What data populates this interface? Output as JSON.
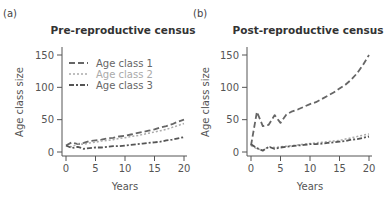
{
  "chart_data": [
    {
      "type": "line",
      "panel": "(a)",
      "title": "Pre-reproductive census",
      "xlabel": "Years",
      "ylabel": "Age class size",
      "xlim": [
        0,
        20
      ],
      "ylim": [
        0,
        150
      ],
      "xticks": [
        0,
        5,
        10,
        15,
        20
      ],
      "yticks": [
        0,
        50,
        100,
        150
      ],
      "grid": false,
      "legend_position": "upper left",
      "x": [
        0,
        1,
        2,
        3,
        4,
        5,
        6,
        7,
        8,
        9,
        10,
        11,
        12,
        13,
        14,
        15,
        16,
        17,
        18,
        19,
        20
      ],
      "series": [
        {
          "name": "Age class 1",
          "style": "dashed",
          "color": "#666666",
          "values": [
            10,
            15,
            12,
            14,
            17,
            18,
            19,
            21,
            22,
            24,
            25,
            27,
            29,
            31,
            33,
            35,
            38,
            40,
            43,
            47,
            50
          ]
        },
        {
          "name": "Age class 2",
          "style": "dotted",
          "color": "#aaaaaa",
          "values": [
            10,
            8,
            13,
            12,
            14,
            15,
            17,
            18,
            19,
            21,
            22,
            24,
            25,
            27,
            29,
            31,
            33,
            35,
            38,
            41,
            44
          ]
        },
        {
          "name": "Age class 3",
          "style": "dash-dot",
          "color": "#555555",
          "values": [
            10,
            6,
            8,
            5,
            6,
            7,
            7,
            8,
            9,
            9,
            10,
            11,
            12,
            13,
            14,
            15,
            16,
            18,
            19,
            21,
            23
          ]
        }
      ]
    },
    {
      "type": "line",
      "panel": "(b)",
      "title": "Post-reproductive census",
      "xlabel": "Years",
      "ylabel": "Age class size",
      "xlim": [
        0,
        20
      ],
      "ylim": [
        0,
        150
      ],
      "xticks": [
        0,
        5,
        10,
        15,
        20
      ],
      "yticks": [
        0,
        50,
        100,
        150
      ],
      "grid": false,
      "x": [
        0,
        1,
        2,
        3,
        4,
        5,
        6,
        7,
        8,
        9,
        10,
        11,
        12,
        13,
        14,
        15,
        16,
        17,
        18,
        19,
        20
      ],
      "series": [
        {
          "name": "Age class 1",
          "style": "dashed",
          "color": "#666666",
          "values": [
            10,
            62,
            40,
            42,
            57,
            45,
            58,
            63,
            66,
            70,
            74,
            77,
            82,
            87,
            92,
            98,
            104,
            112,
            122,
            135,
            150
          ]
        },
        {
          "name": "Age class 2",
          "style": "dotted",
          "color": "#aaaaaa",
          "values": [
            10,
            5,
            3,
            8,
            7,
            8,
            9,
            10,
            11,
            12,
            13,
            14,
            15,
            16,
            17,
            18,
            20,
            22,
            24,
            26,
            28
          ]
        },
        {
          "name": "Age class 3",
          "style": "dash-dot",
          "color": "#555555",
          "values": [
            12,
            6,
            2,
            8,
            5,
            7,
            8,
            9,
            10,
            11,
            12,
            12,
            13,
            14,
            15,
            16,
            17,
            19,
            20,
            22,
            24
          ]
        }
      ]
    }
  ]
}
